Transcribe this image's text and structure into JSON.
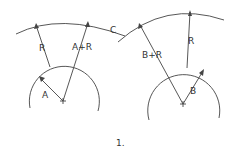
{
  "diagram": {
    "figure_label": "1.",
    "intersection_label": "C",
    "left": {
      "small_circle_label": "A",
      "radius_label": "R",
      "sum_label": "A+R"
    },
    "right": {
      "small_circle_label": "B",
      "radius_label": "R",
      "sum_label": "B+R"
    },
    "colors": {
      "stroke": "#444444",
      "background": "#ffffff"
    }
  }
}
